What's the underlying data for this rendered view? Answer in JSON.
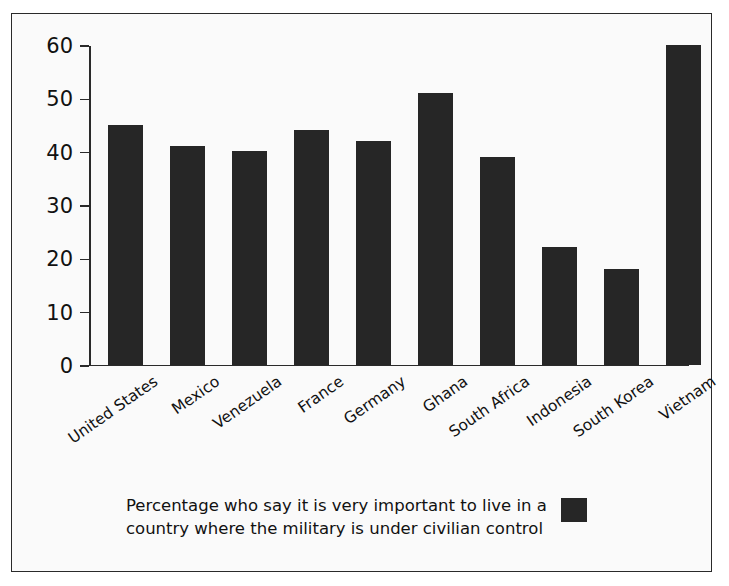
{
  "chart_data": {
    "type": "bar",
    "title": "",
    "subtitle": "",
    "xlabel": "",
    "ylabel": "",
    "ylim": [
      0,
      60
    ],
    "ytick_step": 10,
    "grid": false,
    "legend_position": "bottom-right",
    "categories": [
      "United States",
      "Mexico",
      "Venezuela",
      "France",
      "Germany",
      "Ghana",
      "South Africa",
      "Indonesia",
      "South Korea",
      "Vietnam"
    ],
    "values": [
      45,
      41,
      40,
      44,
      42,
      51,
      39,
      22,
      18,
      60
    ],
    "ytick_labels": [
      "0",
      "10",
      "20",
      "30",
      "40",
      "50",
      "60"
    ],
    "series": [
      {
        "name": "Percentage who say it is very important to live in a country where the military is under civilian control",
        "values": [
          45,
          41,
          40,
          44,
          42,
          51,
          39,
          22,
          18,
          60
        ],
        "color": "#262626"
      }
    ]
  },
  "caption": {
    "line1": "Percentage who say it is very important to live in a",
    "line2": "country where the military is under civilian control",
    "full": "Percentage who say it is very important to live in a country where the military is under civilian control"
  },
  "colors": {
    "bar": "#262626",
    "axis": "#2a2a2a",
    "background": "#fafafa",
    "text": "#111111"
  }
}
